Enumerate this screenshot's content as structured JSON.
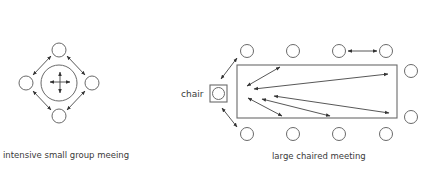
{
  "diagrams": {
    "small_group": {
      "caption": "intensive small group meeing",
      "center_circle": {
        "cx": 59,
        "cy": 83,
        "r": 18
      },
      "participants": [
        {
          "cx": 59,
          "cy": 50
        },
        {
          "cx": 26,
          "cy": 83
        },
        {
          "cx": 92,
          "cy": 83
        },
        {
          "cx": 59,
          "cy": 116
        }
      ],
      "participant_radius": 7
    },
    "large_chaired": {
      "caption": "large chaired meeting",
      "chair_label": "chair",
      "table": {
        "x": 237,
        "y": 65,
        "width": 160,
        "height": 53
      },
      "participants_top": [
        {
          "cx": 247,
          "cy": 51
        },
        {
          "cx": 293,
          "cy": 51
        },
        {
          "cx": 339,
          "cy": 51
        },
        {
          "cx": 386,
          "cy": 51
        }
      ],
      "participants_bottom": [
        {
          "cx": 247,
          "cy": 134
        },
        {
          "cx": 293,
          "cy": 134
        },
        {
          "cx": 339,
          "cy": 134
        },
        {
          "cx": 386,
          "cy": 134
        }
      ],
      "participants_right": [
        {
          "cx": 411,
          "cy": 71
        },
        {
          "cx": 411,
          "cy": 117
        }
      ],
      "participant_radius": 6.5
    }
  },
  "colors": {
    "stroke": "#6a6a6a",
    "arrow": "#444444",
    "text": "#3a3a3a",
    "background": "#ffffff"
  }
}
